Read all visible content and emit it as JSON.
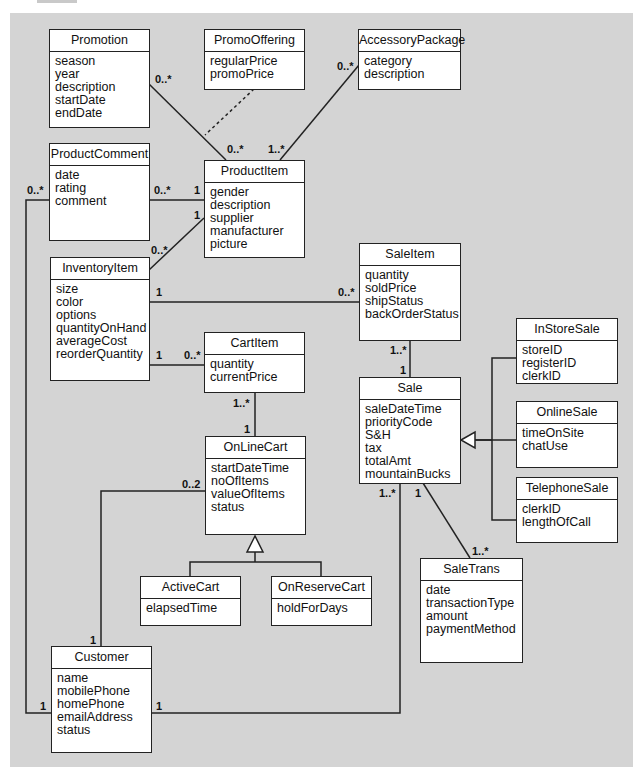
{
  "classes": {
    "promotion": {
      "name": "Promotion",
      "attributes": [
        "season",
        "year",
        "description",
        "startDate",
        "endDate"
      ]
    },
    "promoOffering": {
      "name": "PromoOffering",
      "attributes": [
        "regularPrice",
        "promoPrice"
      ]
    },
    "accessoryPackage": {
      "name": "AccessoryPackage",
      "attributes": [
        "category",
        "description"
      ]
    },
    "productComment": {
      "name": "ProductComment",
      "attributes": [
        "date",
        "rating",
        "comment"
      ]
    },
    "productItem": {
      "name": "ProductItem",
      "attributes": [
        "gender",
        "description",
        "supplier",
        "manufacturer",
        "picture"
      ]
    },
    "inventoryItem": {
      "name": "InventoryItem",
      "attributes": [
        "size",
        "color",
        "options",
        "quantityOnHand",
        "averageCost",
        "reorderQuantity"
      ]
    },
    "saleItem": {
      "name": "SaleItem",
      "attributes": [
        "quantity",
        "soldPrice",
        "shipStatus",
        "backOrderStatus"
      ]
    },
    "cartItem": {
      "name": "CartItem",
      "attributes": [
        "quantity",
        "currentPrice"
      ]
    },
    "inStoreSale": {
      "name": "InStoreSale",
      "attributes": [
        "storeID",
        "registerID",
        "clerkID"
      ]
    },
    "sale": {
      "name": "Sale",
      "attributes": [
        "saleDateTime",
        "priorityCode",
        "S&H",
        "tax",
        "totalAmt",
        "mountainBucks"
      ]
    },
    "onlineSale": {
      "name": "OnlineSale",
      "attributes": [
        "timeOnSite",
        "chatUse"
      ]
    },
    "telephoneSale": {
      "name": "TelephoneSale",
      "attributes": [
        "clerkID",
        "lengthOfCall"
      ]
    },
    "onLineCart": {
      "name": "OnLineCart",
      "attributes": [
        "startDateTime",
        "noOfItems",
        "valueOfItems",
        "status"
      ]
    },
    "activeCart": {
      "name": "ActiveCart",
      "attributes": [
        "elapsedTime"
      ]
    },
    "onReserveCart": {
      "name": "OnReserveCart",
      "attributes": [
        "holdForDays"
      ]
    },
    "saleTrans": {
      "name": "SaleTrans",
      "attributes": [
        "date",
        "transactionType",
        "amount",
        "paymentMethod"
      ]
    },
    "customer": {
      "name": "Customer",
      "attributes": [
        "name",
        "mobilePhone",
        "homePhone",
        "emailAddress",
        "status"
      ]
    }
  },
  "multiplicities": {
    "promotion_to_item": "0..*",
    "item_to_promotion": "0..*",
    "accessory_to_item": "0..*",
    "item_to_accessory": "1..*",
    "comment_to_item": "0..*",
    "item_to_comment": "1",
    "customer_to_comment": "0..*",
    "item_to_inventory": "1",
    "inventory_to_item": "0..*",
    "inventory_to_saleitem": "1",
    "saleitem_from_inventory": "0..*",
    "inventory_to_cartitem": "1",
    "cartitem_from_inventory": "0..*",
    "saleitem_to_sale": "1..*",
    "sale_to_saleitem": "1",
    "cartitem_to_cart": "1..*",
    "cart_to_cartitem": "1",
    "cart_from_customer": "0..2",
    "customer_to_cart": "1",
    "sale_from_customer": "1..*",
    "sale_to_trans": "1",
    "trans_from_sale": "1..*",
    "customer_to_comment_end": "1",
    "customer_to_sale_end": "1"
  },
  "colors": {
    "background": "#d4d4d4",
    "box_fill": "#ffffff",
    "line": "#222222"
  }
}
